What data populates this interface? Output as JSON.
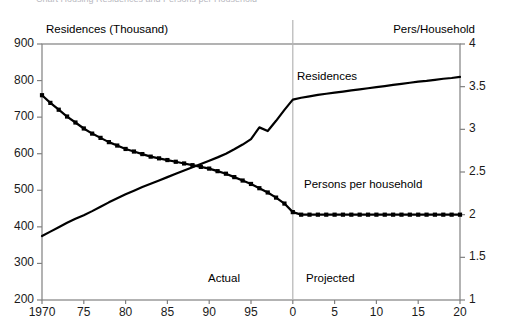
{
  "figure": {
    "cut_title": "Chart Housing Residences and Persons per Household",
    "background": "#ffffff",
    "line_color": "#000000",
    "axis_color": "#808080",
    "divider_color": "#b5b5b5"
  },
  "axes": {
    "left": {
      "label": "Residences (Thousand)",
      "ticks": [
        "900",
        "800",
        "700",
        "600",
        "500",
        "400",
        "300",
        "200"
      ],
      "min": 200,
      "max": 900,
      "step": 100
    },
    "right": {
      "label": "Pers/Household",
      "ticks": [
        "4",
        "3.5",
        "3",
        "2.5",
        "2",
        "1.5",
        "1"
      ],
      "min": 1,
      "max": 4,
      "step": 0.5
    },
    "x": {
      "ticks": [
        "1970",
        "75",
        "80",
        "85",
        "90",
        "95",
        "0",
        "5",
        "10",
        "15",
        "20"
      ],
      "min": 1970,
      "max": 2020
    }
  },
  "annotations": {
    "actual": "Actual",
    "projected": "Projected",
    "divider_year": 2000
  },
  "series_labels": {
    "residences": "Residences",
    "persons_per_household": "Persons per household"
  },
  "chart_data": {
    "type": "line",
    "title": "",
    "subtitle": "",
    "xlabel": "",
    "ylabel": "Residences (Thousand)",
    "y2label": "Pers/Household",
    "xlim": [
      1970,
      2020
    ],
    "ylim": [
      200,
      900
    ],
    "y2lim": [
      1,
      4
    ],
    "grid": false,
    "legend": "inline-annotations",
    "x": [
      1970,
      1971,
      1972,
      1973,
      1974,
      1975,
      1976,
      1977,
      1978,
      1979,
      1980,
      1981,
      1982,
      1983,
      1984,
      1985,
      1986,
      1987,
      1988,
      1989,
      1990,
      1991,
      1992,
      1993,
      1994,
      1995,
      1996,
      1997,
      1998,
      1999,
      2000,
      2001,
      2002,
      2003,
      2004,
      2005,
      2006,
      2007,
      2008,
      2009,
      2010,
      2011,
      2012,
      2013,
      2014,
      2015,
      2016,
      2017,
      2018,
      2019,
      2020
    ],
    "series": [
      {
        "name": "Residences",
        "axis": "left",
        "unit": "Thousand",
        "marker": "none",
        "values": [
          375,
          387,
          399,
          411,
          422,
          432,
          443,
          455,
          467,
          478,
          489,
          499,
          509,
          518,
          527,
          536,
          545,
          554,
          563,
          572,
          581,
          590,
          600,
          612,
          625,
          640,
          672,
          662,
          690,
          720,
          748,
          753,
          757,
          761,
          764,
          767,
          770,
          773,
          776,
          779,
          782,
          785,
          788,
          791,
          794,
          797,
          799,
          802,
          805,
          807,
          810
        ]
      },
      {
        "name": "Persons per household",
        "axis": "right",
        "unit": "persons",
        "marker": "square",
        "values": [
          3.4,
          3.31,
          3.23,
          3.15,
          3.08,
          3.01,
          2.95,
          2.9,
          2.85,
          2.81,
          2.77,
          2.74,
          2.71,
          2.68,
          2.66,
          2.64,
          2.62,
          2.6,
          2.58,
          2.56,
          2.54,
          2.51,
          2.48,
          2.44,
          2.4,
          2.36,
          2.31,
          2.26,
          2.2,
          2.13,
          2.03,
          2.0,
          2.0,
          2.0,
          2.0,
          2.0,
          2.0,
          2.0,
          2.0,
          2.0,
          2.0,
          2.0,
          2.0,
          2.0,
          2.0,
          2.0,
          2.0,
          2.0,
          2.0,
          2.0,
          2.0
        ]
      }
    ]
  }
}
